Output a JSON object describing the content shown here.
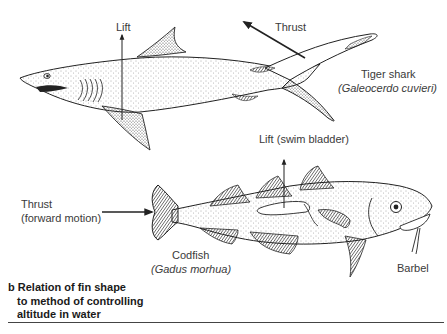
{
  "shark": {
    "lift_label": "Lift",
    "thrust_label": "Thrust",
    "common_name": "Tiger shark",
    "scientific_name": "(Galeocerdo cuvieri)"
  },
  "codfish": {
    "lift_label": "Lift (swim bladder)",
    "thrust_label_line1": "Thrust",
    "thrust_label_line2": "(forward motion)",
    "common_name": "Codfish",
    "scientific_name": "(Gadus morhua)",
    "barbel_label": "Barbel"
  },
  "caption": {
    "letter": "b",
    "line1": "Relation of fin shape",
    "line2": "to method of controlling",
    "line3": "altitude in water"
  },
  "colors": {
    "ink": "#222222",
    "label": "#3a3a3a",
    "background": "#ffffff"
  }
}
